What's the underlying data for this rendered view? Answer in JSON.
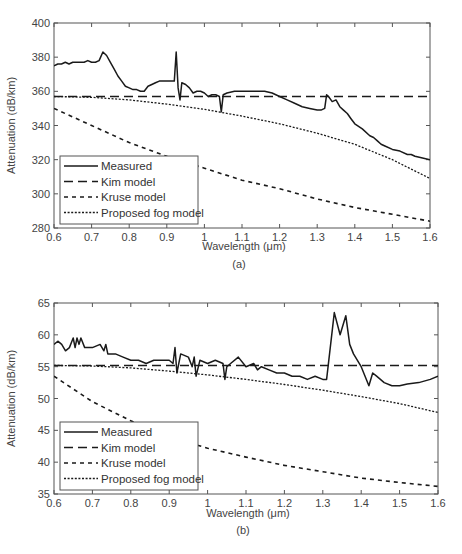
{
  "chart_data": [
    {
      "id": "a",
      "type": "line",
      "caption": "(a)",
      "title": "",
      "xlabel": "Wavelength (μm)",
      "ylabel": "Attenuation (dB/km)",
      "xlim": [
        0.6,
        1.6
      ],
      "ylim": [
        280,
        400
      ],
      "xticks": [
        0.6,
        0.7,
        0.8,
        0.9,
        1,
        1.1,
        1.2,
        1.3,
        1.4,
        1.5,
        1.6
      ],
      "xtick_labels": [
        "0.6",
        "0.7",
        "0.8",
        "0.9",
        "1",
        "1.1",
        "1.2",
        "1.3",
        "1.4",
        "1.5",
        "1.6"
      ],
      "yticks": [
        280,
        300,
        320,
        340,
        360,
        380,
        400
      ],
      "ytick_labels": [
        "280",
        "300",
        "320",
        "340",
        "360",
        "380",
        "400"
      ],
      "grid": false,
      "legend_position": "lower left",
      "legend": [
        "Measured",
        "Kim model",
        "Kruse model",
        "Proposed fog model"
      ],
      "series": [
        {
          "name": "Measured",
          "style": "solid",
          "x": [
            0.6,
            0.61,
            0.62,
            0.63,
            0.64,
            0.65,
            0.66,
            0.67,
            0.68,
            0.69,
            0.7,
            0.71,
            0.72,
            0.73,
            0.74,
            0.75,
            0.76,
            0.77,
            0.78,
            0.79,
            0.8,
            0.81,
            0.82,
            0.83,
            0.84,
            0.85,
            0.86,
            0.87,
            0.88,
            0.89,
            0.9,
            0.91,
            0.92,
            0.925,
            0.93,
            0.935,
            0.94,
            0.95,
            0.96,
            0.97,
            0.98,
            0.99,
            1.0,
            1.01,
            1.02,
            1.03,
            1.04,
            1.045,
            1.05,
            1.06,
            1.08,
            1.1,
            1.12,
            1.14,
            1.16,
            1.18,
            1.2,
            1.22,
            1.24,
            1.26,
            1.28,
            1.3,
            1.31,
            1.32,
            1.325,
            1.33,
            1.34,
            1.35,
            1.36,
            1.37,
            1.38,
            1.39,
            1.4,
            1.42,
            1.44,
            1.45,
            1.46,
            1.47,
            1.48,
            1.5,
            1.52,
            1.54,
            1.55,
            1.56,
            1.58,
            1.6
          ],
          "y": [
            375,
            376,
            376,
            377,
            376,
            377,
            377,
            377,
            377,
            378,
            377,
            377,
            378,
            383,
            381,
            377,
            373,
            369,
            366,
            363,
            362,
            361,
            361,
            360,
            360,
            363,
            364,
            365,
            366,
            366,
            366,
            366,
            366,
            383,
            362,
            355,
            365,
            364,
            362,
            359,
            360,
            360,
            359,
            357,
            358,
            358,
            357,
            348,
            358,
            359,
            360,
            360,
            360,
            360,
            360,
            359,
            357,
            355,
            353,
            351,
            350,
            349,
            349,
            350,
            358,
            357,
            354,
            355,
            351,
            349,
            347,
            344,
            341,
            338,
            334,
            333,
            331,
            329,
            328,
            326,
            325,
            323,
            323,
            322,
            321,
            320
          ]
        },
        {
          "name": "Kim model",
          "style": "dashed",
          "x": [
            0.6,
            1.6
          ],
          "y": [
            357,
            357
          ]
        },
        {
          "name": "Kruse model",
          "style": "dash-dot",
          "x": [
            0.6,
            0.7,
            0.8,
            0.9,
            1.0,
            1.1,
            1.2,
            1.3,
            1.4,
            1.5,
            1.6
          ],
          "y": [
            350,
            340,
            330,
            322,
            315,
            308,
            303,
            297,
            292,
            288,
            284
          ]
        },
        {
          "name": "Proposed fog model",
          "style": "dotted",
          "x": [
            0.6,
            0.7,
            0.8,
            0.9,
            1.0,
            1.1,
            1.2,
            1.3,
            1.4,
            1.5,
            1.6
          ],
          "y": [
            357,
            356.5,
            355,
            352.5,
            349.5,
            345.5,
            341,
            335.5,
            329,
            320,
            309
          ]
        }
      ]
    },
    {
      "id": "b",
      "type": "line",
      "caption": "(b)",
      "title": "",
      "xlabel": "Wavelength (μm)",
      "ylabel": "Attenuation (dB/km)",
      "xlim": [
        0.6,
        1.6
      ],
      "ylim": [
        35,
        65
      ],
      "xticks": [
        0.6,
        0.7,
        0.8,
        0.9,
        1,
        1.1,
        1.2,
        1.3,
        1.4,
        1.5,
        1.6
      ],
      "xtick_labels": [
        "0.6",
        "0.7",
        "0.8",
        "0.9",
        "1",
        "1.1",
        "1.2",
        "1.3",
        "1.4",
        "1.5",
        "1.6"
      ],
      "yticks": [
        35,
        40,
        45,
        50,
        55,
        60,
        65
      ],
      "ytick_labels": [
        "35",
        "40",
        "45",
        "50",
        "55",
        "60",
        "65"
      ],
      "grid": false,
      "legend_position": "lower left",
      "legend": [
        "Measured",
        "Kim model",
        "Kruse model",
        "Proposed fog model"
      ],
      "series": [
        {
          "name": "Measured",
          "style": "solid",
          "x": [
            0.6,
            0.61,
            0.62,
            0.63,
            0.64,
            0.65,
            0.655,
            0.66,
            0.665,
            0.67,
            0.68,
            0.69,
            0.7,
            0.72,
            0.73,
            0.735,
            0.74,
            0.76,
            0.78,
            0.8,
            0.82,
            0.84,
            0.86,
            0.88,
            0.9,
            0.91,
            0.915,
            0.92,
            0.93,
            0.95,
            0.96,
            0.965,
            0.97,
            0.98,
            1.0,
            1.02,
            1.04,
            1.045,
            1.05,
            1.06,
            1.08,
            1.1,
            1.12,
            1.13,
            1.14,
            1.16,
            1.18,
            1.2,
            1.22,
            1.24,
            1.26,
            1.28,
            1.3,
            1.31,
            1.33,
            1.345,
            1.36,
            1.37,
            1.38,
            1.4,
            1.42,
            1.43,
            1.44,
            1.46,
            1.48,
            1.5,
            1.52,
            1.55,
            1.58,
            1.6
          ],
          "y": [
            58.5,
            59,
            58.5,
            57.5,
            58,
            59.5,
            58,
            59.5,
            58.5,
            59.5,
            58,
            58,
            58,
            58.5,
            57.5,
            58.5,
            57,
            57,
            56.5,
            56,
            56,
            55.5,
            56,
            56,
            56,
            55.5,
            58,
            54,
            57,
            56.5,
            55,
            56.5,
            53.5,
            56,
            55.5,
            56,
            55.5,
            53,
            55,
            55.5,
            56.5,
            55,
            55.5,
            54.5,
            55,
            54.5,
            54,
            54,
            53.5,
            53.5,
            53,
            53.5,
            53,
            53,
            63.5,
            60,
            63,
            58.5,
            57,
            55,
            52,
            54,
            53.5,
            52.5,
            52,
            52,
            52.3,
            52.5,
            53,
            53.5
          ]
        },
        {
          "name": "Kim model",
          "style": "dashed",
          "x": [
            0.6,
            1.6
          ],
          "y": [
            55.2,
            55.2
          ]
        },
        {
          "name": "Kruse model",
          "style": "dash-dot",
          "x": [
            0.6,
            0.7,
            0.8,
            0.9,
            1.0,
            1.1,
            1.2,
            1.3,
            1.4,
            1.5,
            1.6
          ],
          "y": [
            53.5,
            49.5,
            46.5,
            44,
            42.2,
            40.8,
            39.5,
            38.5,
            37.5,
            36.8,
            36.2
          ]
        },
        {
          "name": "Proposed fog model",
          "style": "dotted",
          "x": [
            0.6,
            0.7,
            0.8,
            0.9,
            1.0,
            1.1,
            1.2,
            1.3,
            1.4,
            1.5,
            1.6
          ],
          "y": [
            55.2,
            55.1,
            54.8,
            54.3,
            53.7,
            53.0,
            52.2,
            51.3,
            50.3,
            49.2,
            47.8
          ]
        }
      ]
    }
  ],
  "layout": [
    {
      "left": 54,
      "top": 23,
      "right": 430,
      "bottom": 228,
      "caption_y": 268,
      "xlabel_y": 250
    },
    {
      "left": 54,
      "top": 303,
      "right": 438,
      "bottom": 494,
      "caption_y": 534,
      "xlabel_y": 517
    }
  ],
  "colors": {
    "line": "#1a1a1a",
    "axis": "#555555",
    "legend_border": "#555555"
  }
}
